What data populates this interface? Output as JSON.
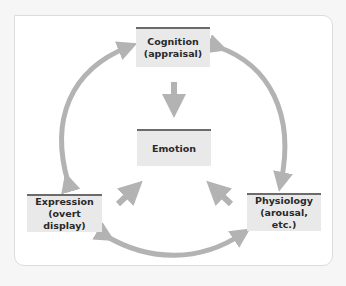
{
  "diagram": {
    "type": "emotion-components-cycle",
    "nodes": {
      "cognition": {
        "line1": "Cognition",
        "line2": "(appraisal)"
      },
      "emotion": {
        "line1": "Emotion"
      },
      "expression": {
        "line1": "Expression",
        "line2": "(overt display)"
      },
      "physiology": {
        "line1": "Physiology",
        "line2": "(arousal, etc.)"
      }
    },
    "edges": [
      {
        "from": "expression",
        "to": "cognition",
        "style": "curved-bidirectional"
      },
      {
        "from": "cognition",
        "to": "physiology",
        "style": "curved-bidirectional"
      },
      {
        "from": "expression",
        "to": "physiology",
        "style": "curved-bidirectional"
      },
      {
        "from": "cognition",
        "to": "emotion",
        "style": "straight"
      },
      {
        "from": "expression",
        "to": "emotion",
        "style": "straight"
      },
      {
        "from": "physiology",
        "to": "emotion",
        "style": "straight"
      }
    ],
    "colors": {
      "arrow": "#b3b3b3",
      "node_fill": "#e9e9e9",
      "node_header": "#6b6b6b",
      "frame_border": "#dcdcdc"
    }
  }
}
